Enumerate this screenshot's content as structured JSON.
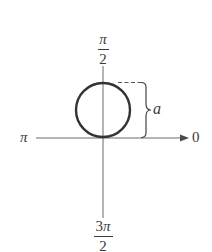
{
  "diagram": {
    "type": "polar-graph",
    "axes": {
      "top_label": {
        "numerator": "π",
        "denominator": "2"
      },
      "bottom_label": {
        "numerator_digit": "3",
        "numerator_symbol": "π",
        "denominator": "2"
      },
      "left_label": "π",
      "right_label": "0"
    },
    "dimension_label": "a",
    "colors": {
      "stroke": "#3a3a3a",
      "axis": "#6a6a6a",
      "background": "#ffffff"
    },
    "geometry": {
      "pole": {
        "x": 103,
        "y": 138
      },
      "circle": {
        "cx": 103,
        "cy": 110,
        "r": 27
      },
      "horizontal_axis": {
        "x1": 36,
        "x2": 188,
        "y": 138
      },
      "vertical_axis": {
        "x": 103,
        "y1": 66,
        "y2": 218
      }
    }
  }
}
